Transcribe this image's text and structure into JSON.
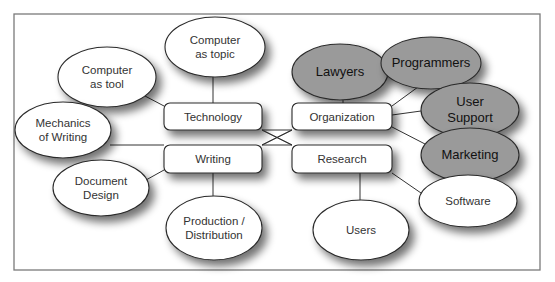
{
  "colors": {
    "frame": "#7a7a7a",
    "node_stroke": "#2a2a2a",
    "white_fill": "#ffffff",
    "gray_fill": "#9a9a9a",
    "line": "#333333"
  },
  "frame": {
    "x": 14,
    "y": 14,
    "w": 526,
    "h": 256
  },
  "boxes": [
    {
      "id": "technology",
      "label": "Technology",
      "x": 164,
      "y": 103,
      "w": 98,
      "h": 27
    },
    {
      "id": "writing",
      "label": "Writing",
      "x": 164,
      "y": 145,
      "w": 98,
      "h": 28
    },
    {
      "id": "organization",
      "label": "Organization",
      "x": 292,
      "y": 103,
      "w": 100,
      "h": 27
    },
    {
      "id": "research",
      "label": "Research",
      "x": 292,
      "y": 145,
      "w": 100,
      "h": 28
    }
  ],
  "ellipses": [
    {
      "id": "computer-as-topic",
      "lines": [
        "Computer",
        "as topic"
      ],
      "cx": 215,
      "cy": 47,
      "rx": 50,
      "ry": 30,
      "style": "white"
    },
    {
      "id": "computer-as-tool",
      "lines": [
        "Computer",
        "as tool"
      ],
      "cx": 107,
      "cy": 77,
      "rx": 49,
      "ry": 30,
      "style": "white"
    },
    {
      "id": "mechanics-of-writing",
      "lines": [
        "Mechanics",
        "of Writing"
      ],
      "cx": 63,
      "cy": 130,
      "rx": 48,
      "ry": 28,
      "style": "white"
    },
    {
      "id": "document-design",
      "lines": [
        "Document",
        "Design"
      ],
      "cx": 101,
      "cy": 188,
      "rx": 48,
      "ry": 28,
      "style": "white"
    },
    {
      "id": "production-distribution",
      "lines": [
        "Production /",
        "Distribution"
      ],
      "cx": 214,
      "cy": 228,
      "rx": 48,
      "ry": 32,
      "style": "white"
    },
    {
      "id": "lawyers",
      "lines": [
        "Lawyers"
      ],
      "cx": 340,
      "cy": 72,
      "rx": 48,
      "ry": 28,
      "style": "gray"
    },
    {
      "id": "programmers",
      "lines": [
        "Programmers"
      ],
      "cx": 431,
      "cy": 63,
      "rx": 50,
      "ry": 26,
      "style": "gray"
    },
    {
      "id": "user-support",
      "lines": [
        "User",
        "Support"
      ],
      "cx": 470,
      "cy": 110,
      "rx": 49,
      "ry": 27,
      "style": "gray"
    },
    {
      "id": "marketing",
      "lines": [
        "Marketing"
      ],
      "cx": 470,
      "cy": 155,
      "rx": 49,
      "ry": 27,
      "style": "gray"
    },
    {
      "id": "software",
      "lines": [
        "Software"
      ],
      "cx": 468,
      "cy": 201,
      "rx": 49,
      "ry": 26,
      "style": "white"
    },
    {
      "id": "users",
      "lines": [
        "Users"
      ],
      "cx": 361,
      "cy": 230,
      "rx": 48,
      "ry": 30,
      "style": "white"
    }
  ],
  "connections": [
    {
      "from": "computer-as-topic",
      "to": "technology",
      "x1": 213,
      "y1": 77,
      "x2": 213,
      "y2": 103
    },
    {
      "from": "computer-as-tool",
      "to": "technology",
      "x1": 145,
      "y1": 96,
      "x2": 164,
      "y2": 106
    },
    {
      "from": "mechanics-of-writing",
      "to": "writing",
      "x1": 110,
      "y1": 145,
      "x2": 164,
      "y2": 145
    },
    {
      "from": "document-design",
      "to": "writing",
      "x1": 146,
      "y1": 180,
      "x2": 164,
      "y2": 170
    },
    {
      "from": "production-distribution",
      "to": "writing",
      "x1": 213,
      "y1": 196,
      "x2": 213,
      "y2": 173
    },
    {
      "from": "lawyers",
      "to": "organization",
      "x1": 343,
      "y1": 100,
      "x2": 343,
      "y2": 103
    },
    {
      "from": "programmers",
      "to": "organization",
      "x1": 418,
      "y1": 87,
      "x2": 392,
      "y2": 106
    },
    {
      "from": "user-support",
      "to": "organization",
      "x1": 421,
      "y1": 111,
      "x2": 392,
      "y2": 115
    },
    {
      "from": "marketing",
      "to": "organization",
      "x1": 425,
      "y1": 144,
      "x2": 392,
      "y2": 127
    },
    {
      "from": "software",
      "to": "research",
      "x1": 421,
      "y1": 193,
      "x2": 392,
      "y2": 173
    },
    {
      "from": "users",
      "to": "research",
      "x1": 360,
      "y1": 200,
      "x2": 360,
      "y2": 173
    },
    {
      "from": "technology",
      "to": "research",
      "x1": 262,
      "y1": 130,
      "x2": 292,
      "y2": 145
    },
    {
      "from": "writing",
      "to": "organization",
      "x1": 262,
      "y1": 145,
      "x2": 292,
      "y2": 130
    },
    {
      "from": "technology",
      "to": "organization",
      "x1": 262,
      "y1": 130,
      "x2": 292,
      "y2": 130
    },
    {
      "from": "writing",
      "to": "research",
      "x1": 262,
      "y1": 145,
      "x2": 292,
      "y2": 145
    }
  ]
}
